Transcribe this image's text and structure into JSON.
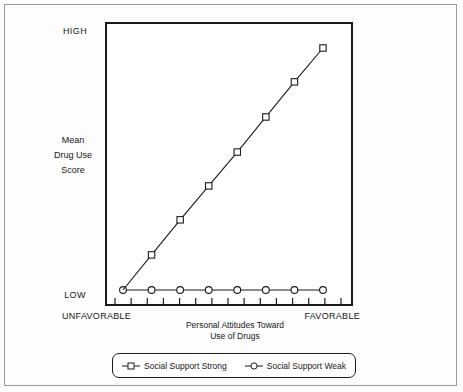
{
  "chart_data": {
    "type": "line",
    "title": "",
    "xlabel": "Personal Attitudes Toward Use of Drugs",
    "ylabel": "Mean Drug Use Score",
    "x_axis": {
      "left_label": "UNFAVORABLE",
      "right_label": "FAVORABLE",
      "title_line1": "Personal Attitudes Toward",
      "title_line2": "Use of Drugs",
      "tick_count": 15,
      "grid": false
    },
    "y_axis": {
      "top_label": "HIGH",
      "bottom_label": "LOW",
      "title_line1": "Mean",
      "title_line2": "Drug Use",
      "title_line3": "Score",
      "ylim": [
        0,
        100
      ],
      "grid": false
    },
    "x": [
      0,
      1,
      2,
      3,
      4,
      5,
      6,
      7
    ],
    "series": [
      {
        "name": "Social Support Strong",
        "marker": "square",
        "values": [
          0,
          14.5,
          29,
          43,
          57,
          71.5,
          86,
          100
        ]
      },
      {
        "name": "Social Support Weak",
        "marker": "circle",
        "values": [
          0,
          0,
          0,
          0,
          0,
          0,
          0,
          0
        ]
      }
    ],
    "legend": {
      "position": "bottom",
      "entries": [
        {
          "label": "Social Support Strong",
          "marker": "square"
        },
        {
          "label": "Social Support Weak",
          "marker": "circle"
        }
      ]
    },
    "colors": {
      "line": "#1a1a1a",
      "marker_fill": "#ffffff",
      "axis": "#1a1a1a",
      "frame": "#9a9a9a",
      "background": "#ffffff"
    }
  }
}
